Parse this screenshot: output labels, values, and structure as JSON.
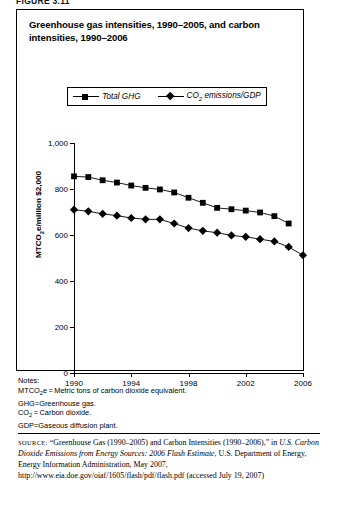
{
  "figure_label": "FIGURE 3.11",
  "title": "Greenhouse gas intensities, 1990–2005, and carbon intensities, 1990–2006",
  "legend": {
    "items": [
      {
        "label": "Total GHG",
        "marker": "square",
        "color": "#000000"
      },
      {
        "label": "CO2 emissions/GDP",
        "marker": "diamond",
        "color": "#000000"
      }
    ]
  },
  "axes": {
    "y_title": "MTCO2e/million $2,000",
    "y_ticks": [
      "0",
      "200",
      "400",
      "600",
      "800",
      "1,000"
    ],
    "x_ticks": [
      "1990",
      "1994",
      "1998",
      "2002",
      "2006"
    ]
  },
  "notes": {
    "heading": "Notes:",
    "lines": [
      "MTCO2e=Metric tons of carbon dioxide equivalent.",
      "GHG=Greenhouse gas.",
      "CO2=Carbon dioxide.",
      "GDP=Gaseous diffusion plant."
    ]
  },
  "source": {
    "label": "SOURCE:",
    "text": "“Greenhouse Gas (1990–2005) and Carbon Intensities (1990–2006),” in ",
    "italic_title": "U.S. Carbon Dioxide Emissions from Energy Sources: 2006 Flash Estimate",
    "tail": ", U.S. Department of Energy, Energy Information Administration, May 2007, http://www.eia.doe.gov/oiaf/1605/flash/pdf/flash.pdf (accessed July 19, 2007)"
  },
  "chart_data": {
    "type": "line",
    "title": "Greenhouse gas intensities, 1990–2005, and carbon intensities, 1990–2006",
    "xlabel": "",
    "ylabel": "MTCO2e/million $2,000",
    "xlim": [
      1990,
      2006
    ],
    "ylim": [
      0,
      1000
    ],
    "grid": false,
    "legend_position": "top-center",
    "x": [
      1990,
      1991,
      1992,
      1993,
      1994,
      1995,
      1996,
      1997,
      1998,
      1999,
      2000,
      2001,
      2002,
      2003,
      2004,
      2005,
      2006
    ],
    "series": [
      {
        "name": "Total GHG",
        "marker": "square",
        "color": "#000000",
        "x": [
          1990,
          1991,
          1992,
          1993,
          1994,
          1995,
          1996,
          1997,
          1998,
          1999,
          2000,
          2001,
          2002,
          2003,
          2004,
          2005
        ],
        "values": [
          855,
          852,
          838,
          828,
          815,
          805,
          798,
          785,
          762,
          740,
          718,
          712,
          706,
          698,
          682,
          650
        ]
      },
      {
        "name": "CO2 emissions/GDP",
        "marker": "diamond",
        "color": "#000000",
        "x": [
          1990,
          1991,
          1992,
          1993,
          1994,
          1995,
          1996,
          1997,
          1998,
          1999,
          2000,
          2001,
          2002,
          2003,
          2004,
          2005,
          2006
        ],
        "values": [
          710,
          703,
          692,
          684,
          674,
          668,
          668,
          650,
          630,
          618,
          610,
          598,
          592,
          582,
          572,
          548,
          512
        ]
      }
    ]
  }
}
